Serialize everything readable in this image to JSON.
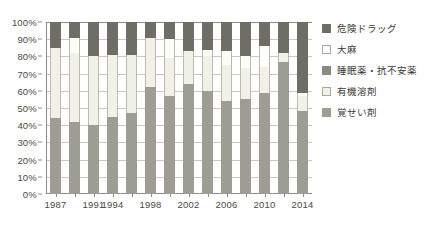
{
  "chart_data": {
    "type": "bar",
    "subtype": "stacked-100-percent",
    "title": "",
    "xlabel": "",
    "ylabel": "",
    "ylim": [
      0,
      100
    ],
    "yticks": [
      "0%",
      "10%",
      "20%",
      "30%",
      "40%",
      "50%",
      "60%",
      "70%",
      "80%",
      "90%",
      "100%"
    ],
    "grid": true,
    "legend_position": "right",
    "x": [
      "1987",
      "1989",
      "1991",
      "1994",
      "1996",
      "1998",
      "2000",
      "2002",
      "2004",
      "2006",
      "2008",
      "2010",
      "2012",
      "2014"
    ],
    "xtick_labels": [
      "1987",
      "",
      "1991",
      "1994",
      "",
      "1998",
      "",
      "2002",
      "",
      "2006",
      "",
      "2010",
      "",
      "2014"
    ],
    "series": [
      {
        "name": "覚せい剤",
        "color": "#9d9d94",
        "values": [
          44,
          42,
          40,
          45,
          47,
          62,
          57,
          64,
          60,
          54,
          55,
          59,
          77,
          48
        ]
      },
      {
        "name": "有機溶剤",
        "color": "#f2f1e7",
        "values": [
          41,
          40,
          40,
          36,
          34,
          29,
          22,
          19,
          20,
          21,
          18,
          15,
          5,
          9
        ]
      },
      {
        "name": "睡眠薬・抗不安薬",
        "color": "#8a8a80",
        "values": [
          0,
          0,
          0,
          0,
          0,
          0,
          0,
          0,
          0,
          0,
          0,
          0,
          0,
          0
        ]
      },
      {
        "name": "大麻",
        "color": "#fdfdf9",
        "values": [
          0,
          9,
          0,
          0,
          0,
          0,
          11,
          0,
          4,
          8,
          7,
          12,
          0,
          2
        ]
      },
      {
        "name": "危険ドラッグ",
        "color": "#6e6e66",
        "values": [
          15,
          9,
          20,
          19,
          19,
          9,
          10,
          17,
          16,
          17,
          20,
          14,
          18,
          41
        ]
      }
    ],
    "legend": [
      {
        "label": "危険ドラッグ",
        "swatch": "kiken",
        "color": "#6e6e66"
      },
      {
        "label": "大麻",
        "swatch": "taima",
        "color": "#fdfdf9"
      },
      {
        "label": "睡眠薬・抗不安薬",
        "swatch": "suimin",
        "color": "#8a8a80"
      },
      {
        "label": "有機溶剤",
        "swatch": "yuki",
        "color": "#f2f1e7"
      },
      {
        "label": "覚せい剤",
        "swatch": "kakusei",
        "color": "#9d9d94"
      }
    ]
  }
}
